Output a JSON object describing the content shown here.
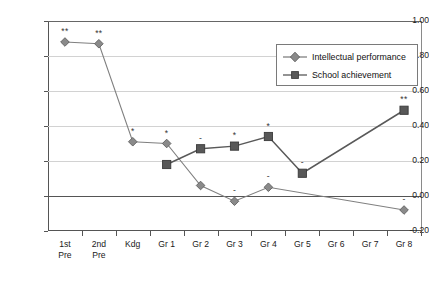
{
  "chart_data": {
    "type": "line",
    "title": "",
    "subtitle": "",
    "xlabel": "",
    "ylabel": "",
    "categories": [
      "1st\nPre",
      "2nd\nPre",
      "Kdg",
      "Gr 1",
      "Gr 2",
      "Gr 3",
      "Gr 4",
      "Gr 5",
      "Gr 6",
      "Gr 7",
      "Gr 8"
    ],
    "ylim": [
      -0.2,
      1.0
    ],
    "yticks": [
      1.0,
      0.8,
      0.6,
      0.4,
      0.2,
      0.0,
      -0.2
    ],
    "ytick_labels": [
      "1.00",
      "0.80",
      "0.60",
      "0.40",
      "0.20",
      "0.00",
      "-0.20"
    ],
    "grid": true,
    "legend_position": "top-right",
    "series": [
      {
        "name": "Intellectual performance",
        "marker": "diamond",
        "color": "#808080",
        "x": [
          "1st\nPre",
          "2nd\nPre",
          "Kdg",
          "Gr 1",
          "Gr 2",
          "Gr 3",
          "Gr 4",
          "Gr 8"
        ],
        "values": [
          0.88,
          0.87,
          0.31,
          0.3,
          0.06,
          -0.03,
          0.05,
          -0.08
        ],
        "annotations": [
          "**",
          "**",
          "*",
          "*",
          "",
          "-",
          "-",
          "-"
        ]
      },
      {
        "name": "School achievement",
        "marker": "square",
        "color": "#595959",
        "x": [
          "Gr 1",
          "Gr 2",
          "Gr 3",
          "Gr 4",
          "Gr 5",
          "Gr 8"
        ],
        "values": [
          0.18,
          0.27,
          0.285,
          0.34,
          0.13,
          0.49
        ],
        "annotations": [
          "",
          "-",
          "*",
          "*",
          "-",
          "**"
        ]
      }
    ]
  },
  "legend": {
    "items": [
      {
        "label": "Intellectual performance",
        "marker": "diamond",
        "color": "#808080"
      },
      {
        "label": "School achievement",
        "marker": "square",
        "color": "#595959"
      }
    ]
  }
}
